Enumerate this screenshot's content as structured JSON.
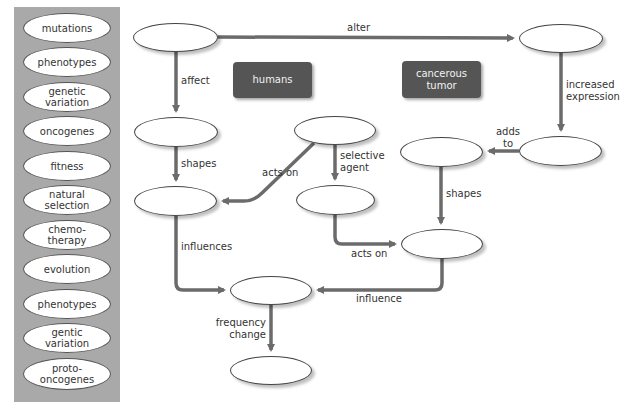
{
  "term_bank": {
    "terms": [
      "mutations",
      "phenotypes",
      "genetic\nvariation",
      "oncogenes",
      "fitness",
      "natural\nselection",
      "chemo-\ntherapy",
      "evolution",
      "phenotypes",
      "gentic\nvariation",
      "proto-\noncogenes"
    ]
  },
  "context_boxes": {
    "humans": "humans",
    "tumor": "cancerous\ntumor"
  },
  "links": {
    "alter": "alter",
    "affect": "affect",
    "increased_expression": "increased\nexpression",
    "adds_to": "adds\nto",
    "shapes_left": "shapes",
    "acts_on_diag": "acts on",
    "selective_agent": "selective\nagent",
    "shapes_right": "shapes",
    "acts_on_bottom": "acts on",
    "influences": "influences",
    "influence": "influence",
    "frequency_change": "frequency\nchange"
  },
  "colors": {
    "panel": "#a9a9a9",
    "arrow": "#6b6b6b",
    "context_box": "#555555"
  }
}
